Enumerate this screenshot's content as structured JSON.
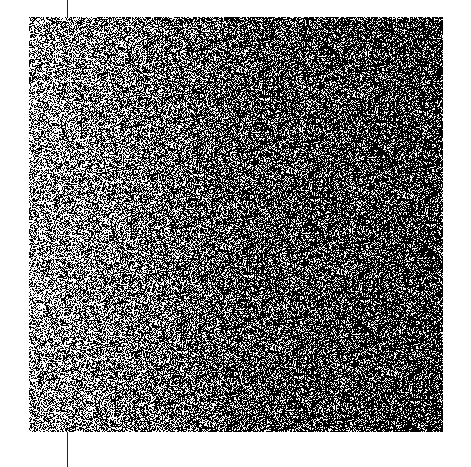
{
  "image": {
    "description": "Square field of random black and white noise, lighter toward the left edge and darker toward the right",
    "noise": {
      "x": 29,
      "y": 17,
      "width": 414,
      "height": 415,
      "dark_color": "#000000",
      "light_color": "#ffffff",
      "left_brightness": 0.55,
      "center_brightness": 0.3,
      "right_brightness": 0.22
    },
    "guide_line": {
      "x": 67,
      "color": "#222222",
      "top_segment": [
        0,
        17
      ],
      "bottom_segment": [
        432,
        467
      ]
    }
  }
}
